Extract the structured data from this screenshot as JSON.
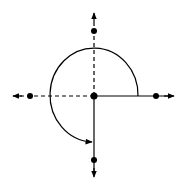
{
  "diagram": {
    "colors": {
      "stroke": "#000000",
      "background": "#ffffff"
    },
    "center": {
      "x": 94,
      "y": 96
    },
    "arc": {
      "radius": 45,
      "start_direction": "right",
      "end_direction": "down",
      "sweep_degrees": 270
    },
    "axes": [
      {
        "direction": "up",
        "style": "dashed",
        "dot": true,
        "arrow": true
      },
      {
        "direction": "left",
        "style": "dashed",
        "dot": true,
        "arrow": true
      },
      {
        "direction": "right",
        "style": "solid",
        "dot": true,
        "arrow": true
      },
      {
        "direction": "down",
        "style": "solid",
        "dot": true,
        "arrow": true
      }
    ]
  }
}
